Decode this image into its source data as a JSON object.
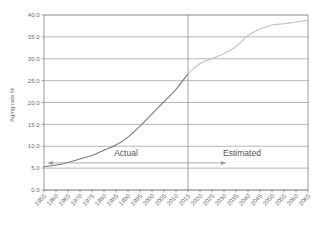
{
  "chart_data": {
    "type": "line",
    "title": "",
    "xlabel": "",
    "ylabel": "Aging rate %",
    "ylim": [
      0.0,
      40.0
    ],
    "ytick_step": 5.0,
    "grid": true,
    "legend": "none",
    "yticks": [
      "0.0",
      "5.0",
      "10.0",
      "15.0",
      "20.0",
      "25.0",
      "30.0",
      "35.0",
      "40.0"
    ],
    "categories": [
      "1955",
      "1960",
      "1965",
      "1970",
      "1975",
      "1980",
      "1985",
      "1990",
      "1995",
      "2000",
      "2005",
      "2010",
      "2015",
      "2020",
      "2025",
      "2030",
      "2035",
      "2040",
      "2045",
      "2050",
      "2055",
      "2060",
      "2065"
    ],
    "series": [
      {
        "name": "Actual",
        "color": "#7a7a7a",
        "x": [
          "1955",
          "1960",
          "1965",
          "1970",
          "1975",
          "1980",
          "1985",
          "1990",
          "1995",
          "2000",
          "2005",
          "2010",
          "2015"
        ],
        "values": [
          5.3,
          5.7,
          6.3,
          7.1,
          7.9,
          9.1,
          10.3,
          12.1,
          14.6,
          17.4,
          20.2,
          23.0,
          26.6
        ]
      },
      {
        "name": "Estimated",
        "color": "#c2c2c2",
        "x": [
          "2015",
          "2020",
          "2025",
          "2030",
          "2035",
          "2040",
          "2045",
          "2050",
          "2055",
          "2060",
          "2065"
        ],
        "values": [
          26.6,
          28.9,
          30.0,
          31.2,
          32.8,
          35.3,
          36.8,
          37.7,
          38.0,
          38.4,
          38.8
        ]
      }
    ],
    "annotations": [
      {
        "label": "Actual",
        "arrow": "left",
        "position": "left-of-divider"
      },
      {
        "label": "Estimated",
        "arrow": "right",
        "position": "right-of-divider"
      }
    ],
    "divider_year": "2015"
  },
  "labels": {
    "actual": "Actual",
    "estimated": "Estimated",
    "y_axis_title": "Aging rate %"
  },
  "colors": {
    "actual_line": "#7a7a7a",
    "estimated_line": "#c2c2c2",
    "grid": "#9a9a9a",
    "axis": "#808080",
    "text": "#6b6b6b",
    "background": "#ffffff"
  }
}
